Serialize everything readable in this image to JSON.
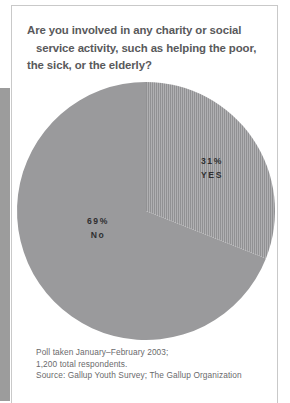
{
  "title": {
    "line1": "Are you involved in any charity or social",
    "line2": "service activity, such as helping the poor,",
    "line3": "the sick, or the elderly?"
  },
  "labels": {
    "yes_pct": "31%",
    "yes_name": "YES",
    "no_pct": "69%",
    "no_name": "No"
  },
  "footnote": {
    "line1": "Poll taken January–February 2003;",
    "line2": "1,200 total respondents.",
    "line3": "Source: Gallup Youth Survey; The Gallup Organization"
  },
  "colors": {
    "slice_no": "#9a9a9c",
    "slice_yes": "#a8a8aa",
    "slice_yes_hatch": "#8e8e90",
    "title_text": "#59595b",
    "label_text": "#2f2f31",
    "footnote_text": "#6a6a6c",
    "frame_border": "#c9c9c9",
    "left_bar": "#9c9c9c",
    "background": "#ffffff"
  },
  "chart_data": {
    "type": "pie",
    "title": "Are you involved in any charity or social service activity, such as helping the poor, the sick, or the elderly?",
    "categories": [
      "YES",
      "No"
    ],
    "values": [
      31,
      69
    ],
    "unit": "%",
    "labels": [
      "31% YES",
      "69% No"
    ],
    "start_angle_deg": 0,
    "direction": "clockwise",
    "legend": "none",
    "grid": false,
    "annotations": [
      "Poll taken January–February 2003;",
      "1,200 total respondents.",
      "Source: Gallup Youth Survey; The Gallup Organization"
    ]
  }
}
